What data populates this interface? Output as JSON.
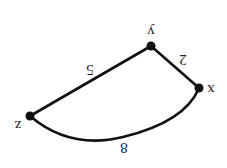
{
  "diagram": {
    "type": "graph",
    "orientation": "rotated-180",
    "colors": {
      "edge": "#111111",
      "node": "#111111",
      "text": "#222222",
      "background": "#ffffff"
    },
    "nodes": [
      {
        "id": "y",
        "label": "y",
        "x": 151,
        "y": 46,
        "label_x": 151,
        "label_y": 30
      },
      {
        "id": "x",
        "label": "x",
        "x": 199,
        "y": 88,
        "label_x": 211,
        "label_y": 88
      },
      {
        "id": "z",
        "label": "z",
        "x": 30,
        "y": 116,
        "label_x": 18,
        "label_y": 124
      }
    ],
    "edges": [
      {
        "from": "z",
        "to": "y",
        "weight": "5",
        "shape": "straight",
        "label_x": 90,
        "label_y": 68
      },
      {
        "from": "y",
        "to": "x",
        "weight": "2",
        "shape": "straight",
        "label_x": 183,
        "label_y": 58
      },
      {
        "from": "z",
        "to": "x",
        "weight": "8",
        "shape": "curved",
        "label_x": 124,
        "label_y": 146
      }
    ]
  }
}
